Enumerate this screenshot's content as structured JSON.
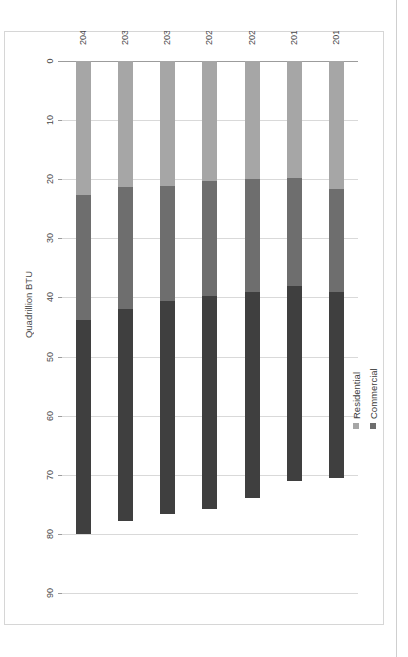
{
  "chart_data": {
    "type": "bar",
    "orientation": "horizontal-rotated",
    "title": "",
    "xlabel": "",
    "ylabel": "Quadrillion BTU",
    "categories": [
      "2011",
      "2015",
      "2020",
      "2025",
      "2030",
      "2035",
      "2040"
    ],
    "tick_labels": [
      "0",
      "10",
      "20",
      "30",
      "40",
      "50",
      "60",
      "70",
      "80",
      "90"
    ],
    "ylim": [
      0,
      90
    ],
    "grid": true,
    "legend_position": "top-right",
    "stacked": true,
    "series": [
      {
        "name": "Residential",
        "color": "#a6a6a6",
        "values": [
          21.6,
          19.8,
          20.0,
          20.3,
          21.1,
          21.4,
          22.7
        ]
      },
      {
        "name": "Commercial",
        "color": "#6e6e6e",
        "values": [
          17.5,
          18.2,
          19.0,
          19.5,
          19.5,
          20.5,
          21.1
        ]
      },
      {
        "name": "Industrial",
        "color": "#3f3f3f",
        "values": [
          31.4,
          33.0,
          35.0,
          36.0,
          36.0,
          36.0,
          36.2
        ]
      }
    ],
    "totals": [
      70.5,
      71.0,
      74.0,
      75.8,
      76.6,
      77.9,
      80.0
    ]
  },
  "legend": {
    "items": [
      {
        "label": "Industrial",
        "color": "#3f3f3f"
      },
      {
        "label": "Commercial",
        "color": "#6e6e6e"
      },
      {
        "label": "Residential",
        "color": "#a6a6a6"
      }
    ]
  },
  "axis": {
    "value_axis_title": "Quadrillion BTU"
  },
  "colors": {
    "gridline": "#d9d9d9",
    "axis": "#9c9c9c",
    "text": "#4a4a4a",
    "frame": "#d6d6d6",
    "background": "#ffffff"
  }
}
